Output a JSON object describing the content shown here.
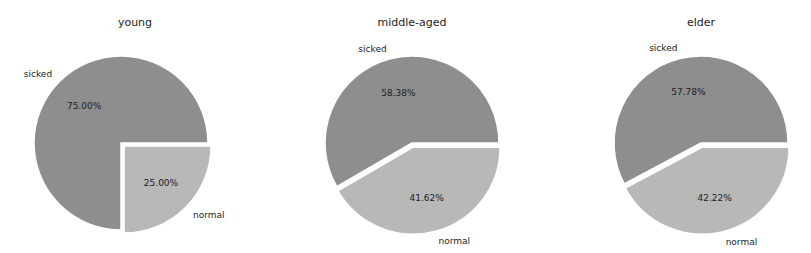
{
  "chart_data": [
    {
      "type": "pie",
      "title": "young",
      "labels": [
        "sicked",
        "normal"
      ],
      "values": [
        75.0,
        25.0
      ],
      "autopct": [
        "75.00%",
        "25.00%"
      ],
      "colors": [
        "#8e8e8e",
        "#b8b8b8"
      ],
      "explode": [
        0,
        0.05
      ]
    },
    {
      "type": "pie",
      "title": "middle-aged",
      "labels": [
        "sicked",
        "normal"
      ],
      "values": [
        58.38,
        41.62
      ],
      "autopct": [
        "58.38%",
        "41.62%"
      ],
      "colors": [
        "#8e8e8e",
        "#b8b8b8"
      ],
      "explode": [
        0,
        0.05
      ]
    },
    {
      "type": "pie",
      "title": "elder",
      "labels": [
        "sicked",
        "normal"
      ],
      "values": [
        57.78,
        42.22
      ],
      "autopct": [
        "57.78%",
        "42.22%"
      ],
      "colors": [
        "#8e8e8e",
        "#b8b8b8"
      ],
      "explode": [
        0,
        0.05
      ]
    }
  ]
}
